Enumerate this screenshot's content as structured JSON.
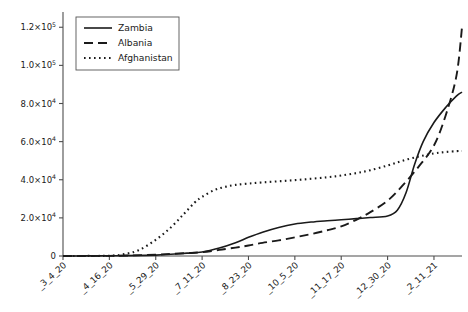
{
  "chart_data": {
    "type": "line",
    "title": "",
    "xlabel": "",
    "ylabel": "",
    "grid": false,
    "legend_position": "upper left",
    "ylim": [
      0,
      128000
    ],
    "ytick_values": [
      0,
      20000,
      40000,
      60000,
      80000,
      100000,
      120000
    ],
    "ytick_labels": [
      "0",
      "2.0×10",
      "4.0×10",
      "6.0×10",
      "8.0×10",
      "1.0×10",
      "1.2×10"
    ],
    "ytick_exponents": [
      "",
      "4",
      "4",
      "4",
      "4",
      "5",
      "5"
    ],
    "categories": [
      "_3_4_20",
      "_4_16_20",
      "_5_29_20",
      "_7_11_20",
      "_8_23_20",
      "_10_5_20",
      "_11_17_20",
      "_12_30_20",
      "_2_11_21"
    ],
    "xtick_positions": [
      0,
      43,
      86,
      129,
      172,
      215,
      258,
      301,
      344
    ],
    "x_range": [
      0,
      370
    ],
    "series": [
      {
        "name": "Zambia",
        "style": "solid",
        "x": [
          0,
          20,
          43,
          60,
          86,
          100,
          115,
          129,
          145,
          160,
          172,
          185,
          200,
          215,
          230,
          245,
          258,
          272,
          285,
          301,
          310,
          318,
          326,
          334,
          344,
          355,
          365,
          370
        ],
        "values": [
          20,
          40,
          100,
          180,
          450,
          900,
          1500,
          2100,
          4200,
          7000,
          9800,
          12500,
          15000,
          16800,
          17800,
          18500,
          19000,
          19600,
          20200,
          21000,
          24000,
          33000,
          48000,
          60000,
          70000,
          78000,
          84000,
          86000
        ]
      },
      {
        "name": "Albania",
        "style": "dashed",
        "x": [
          0,
          20,
          43,
          60,
          86,
          100,
          115,
          129,
          145,
          160,
          172,
          185,
          200,
          215,
          230,
          245,
          258,
          272,
          285,
          301,
          315,
          330,
          344,
          355,
          365,
          370
        ],
        "values": [
          10,
          30,
          80,
          250,
          700,
          1100,
          1500,
          2000,
          3200,
          4400,
          5500,
          6900,
          8200,
          9800,
          11500,
          13500,
          15500,
          19000,
          23000,
          29000,
          37000,
          47000,
          58000,
          74000,
          95000,
          120000
        ]
      },
      {
        "name": "Afghanistan",
        "style": "dotted",
        "x": [
          0,
          20,
          43,
          55,
          70,
          86,
          100,
          112,
          122,
          129,
          140,
          150,
          160,
          172,
          185,
          200,
          215,
          230,
          245,
          258,
          272,
          285,
          301,
          315,
          330,
          344,
          355,
          365,
          370
        ],
        "values": [
          15,
          35,
          120,
          800,
          3000,
          8500,
          15000,
          22000,
          28000,
          31000,
          34500,
          36200,
          37300,
          38000,
          38600,
          39200,
          39800,
          40500,
          41300,
          42200,
          43500,
          45000,
          47500,
          50000,
          52200,
          53800,
          54600,
          55000,
          55100
        ]
      }
    ]
  },
  "legend": {
    "entries": [
      "Zambia",
      "Albania",
      "Afghanistan"
    ]
  }
}
